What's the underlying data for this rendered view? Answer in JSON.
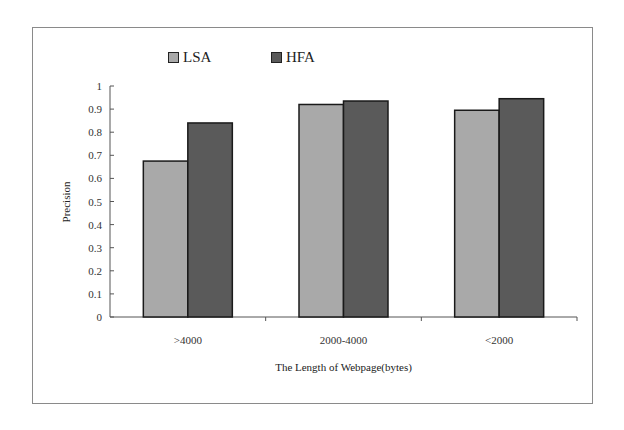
{
  "chart_data": {
    "type": "bar",
    "title": "",
    "xlabel": "The Length of Webpage(bytes)",
    "ylabel": "Precision",
    "ylim": [
      0,
      1
    ],
    "yticks": [
      "0",
      "0.1",
      "0.2",
      "0.3",
      "0.4",
      "0.5",
      "0.6",
      "0.7",
      "0.8",
      "0.9",
      "1"
    ],
    "categories": [
      ">4000",
      "2000-4000",
      "<2000"
    ],
    "series": [
      {
        "name": "LSA",
        "color": "#a9a9a9",
        "values": [
          0.675,
          0.92,
          0.895
        ]
      },
      {
        "name": "HFA",
        "color": "#5a5a5a",
        "values": [
          0.84,
          0.935,
          0.945
        ]
      }
    ],
    "grid": false,
    "legend_position": "top"
  },
  "legend": {
    "items": [
      {
        "label": "LSA",
        "color": "#a9a9a9"
      },
      {
        "label": "HFA",
        "color": "#5a5a5a"
      }
    ]
  }
}
